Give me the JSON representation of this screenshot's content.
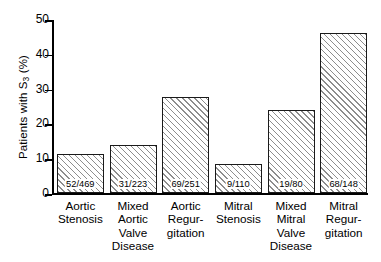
{
  "chart_data": {
    "type": "bar",
    "title": "",
    "xlabel": "",
    "ylabel": "Patients with S3 (%)",
    "ylabel_prefix": "Patients with S",
    "ylabel_sub": "3",
    "ylabel_suffix": " (%)",
    "ylim": [
      0,
      50
    ],
    "yticks": [
      0,
      10,
      20,
      30,
      40,
      50
    ],
    "ytick_labels": [
      "0",
      "10",
      "20",
      "30",
      "40",
      "50"
    ],
    "grid": false,
    "legend": "none",
    "categories": [
      "Aortic\nStenosis",
      "Mixed\nAortic\nValve\nDisease",
      "Aortic\nRegur-\ngitation",
      "Mitral\nStenosis",
      "Mixed\nMitral\nValve\nDisease",
      "Mitral\nRegur-\ngitation"
    ],
    "values": [
      11.1,
      13.9,
      27.5,
      8.2,
      23.8,
      45.9
    ],
    "data_labels": [
      "52/469",
      "31/223",
      "69/251",
      "9/110",
      "19/80",
      "68/148"
    ],
    "numerators": [
      52,
      31,
      69,
      9,
      19,
      68
    ],
    "denominators": [
      469,
      223,
      251,
      110,
      80,
      148
    ],
    "bar_style": {
      "fill": "#ffffff",
      "hatch": "diagonal-45",
      "hatch_color": "#8d8d8d",
      "edge_color": "#1a1a1a"
    },
    "axis_color": "#000000",
    "background": "#ffffff"
  }
}
